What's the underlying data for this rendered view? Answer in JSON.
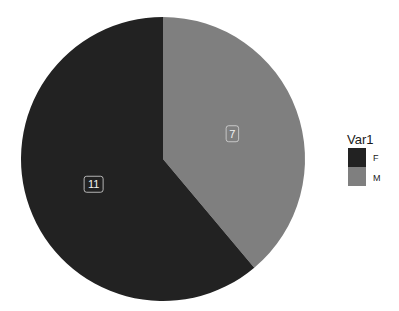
{
  "chart_data": {
    "type": "pie",
    "title": "",
    "categories": [
      "F",
      "M"
    ],
    "values": [
      11,
      7
    ],
    "labels": [
      "11",
      "7"
    ],
    "colors": [
      "#222222",
      "#7f7f7f"
    ],
    "start_angle_deg": 0,
    "direction": "clockwise",
    "legend": {
      "title": "Var1",
      "position": "right",
      "entries": [
        {
          "label": "F",
          "color": "#222222"
        },
        {
          "label": "M",
          "color": "#7f7f7f"
        }
      ]
    }
  },
  "layout": {
    "center": [
      163,
      159
    ],
    "radius": 142
  }
}
